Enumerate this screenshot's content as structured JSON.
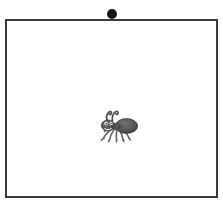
{
  "scene": {
    "title": "Ant inside bordered frame",
    "background_color": "#ffffff",
    "width": 223,
    "height": 202
  },
  "marker": {
    "name": "dot",
    "shape": "filled-circle",
    "color": "#131313",
    "diameter": 10,
    "center_x": 112,
    "center_y": 14,
    "label": "dot"
  },
  "frame": {
    "name": "rectangle",
    "shape": "rectangle",
    "border_color": "#3a3a3a",
    "border_width": 2,
    "fill_color": "#ffffff",
    "x": 5,
    "y": 19,
    "width": 213,
    "height": 179,
    "label": "frame"
  },
  "subject": {
    "name": "ant",
    "label": "ant",
    "description": "small grayscale ant facing left with two antennae, head, thorax, rounded abdomen and six legs",
    "body_color": "#5d5d5d",
    "outline_color": "#4a4a4a",
    "leg_color": "#6a6a6a",
    "center_x": 111,
    "center_y": 106,
    "width": 46,
    "height": 40,
    "orientation": "facing-left"
  }
}
